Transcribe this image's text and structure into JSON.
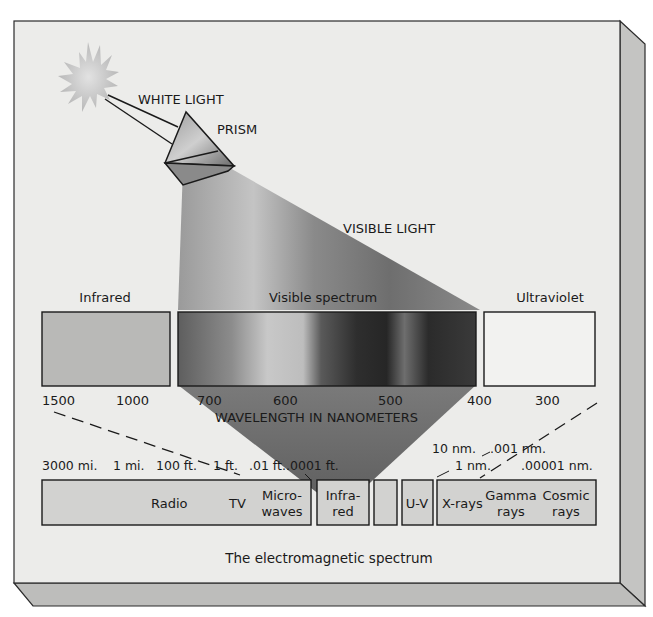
{
  "diagram": {
    "title": "The electromagnetic spectrum",
    "source_labels": {
      "white_light": "WHITE LIGHT",
      "prism": "PRISM",
      "visible_light": "VISIBLE LIGHT"
    },
    "top_band": {
      "infrared_label": "Infrared",
      "visible_label": "Visible spectrum",
      "ultraviolet_label": "Ultraviolet",
      "ticks": [
        "1500",
        "1000",
        "700",
        "600",
        "500",
        "400",
        "300"
      ],
      "axis_label": "WAVELENGTH IN NANOMETERS"
    },
    "bottom_band": {
      "scale_left": [
        "3000 mi.",
        "1 mi.",
        "100 ft.",
        "1 ft.",
        ".01 ft.",
        ".0001 ft."
      ],
      "scale_right_upper": [
        "10 nm.",
        ".001 nm."
      ],
      "scale_right_lower": [
        "1 nm.",
        ".00001 nm."
      ],
      "segments": {
        "radio": "Radio",
        "tv": "TV",
        "microwaves_1": "Micro-",
        "microwaves_2": "waves",
        "infrared_1": "Infra-",
        "infrared_2": "red",
        "visible": "",
        "uv": "U-V",
        "xrays": "X-rays",
        "gamma_1": "Gamma",
        "gamma_2": "rays",
        "cosmic_1": "Cosmic",
        "cosmic_2": "rays"
      }
    },
    "colors": {
      "panel_face": "#ececea",
      "panel_side": "#c4c4c2",
      "panel_bottom": "#bdbdbb",
      "outline": "#2b2b2b",
      "box_fill": "#d2d2d0",
      "infrared_box": "#b9b9b7",
      "beam": "#7a7a7a",
      "sun": "#c9c9c9"
    }
  }
}
